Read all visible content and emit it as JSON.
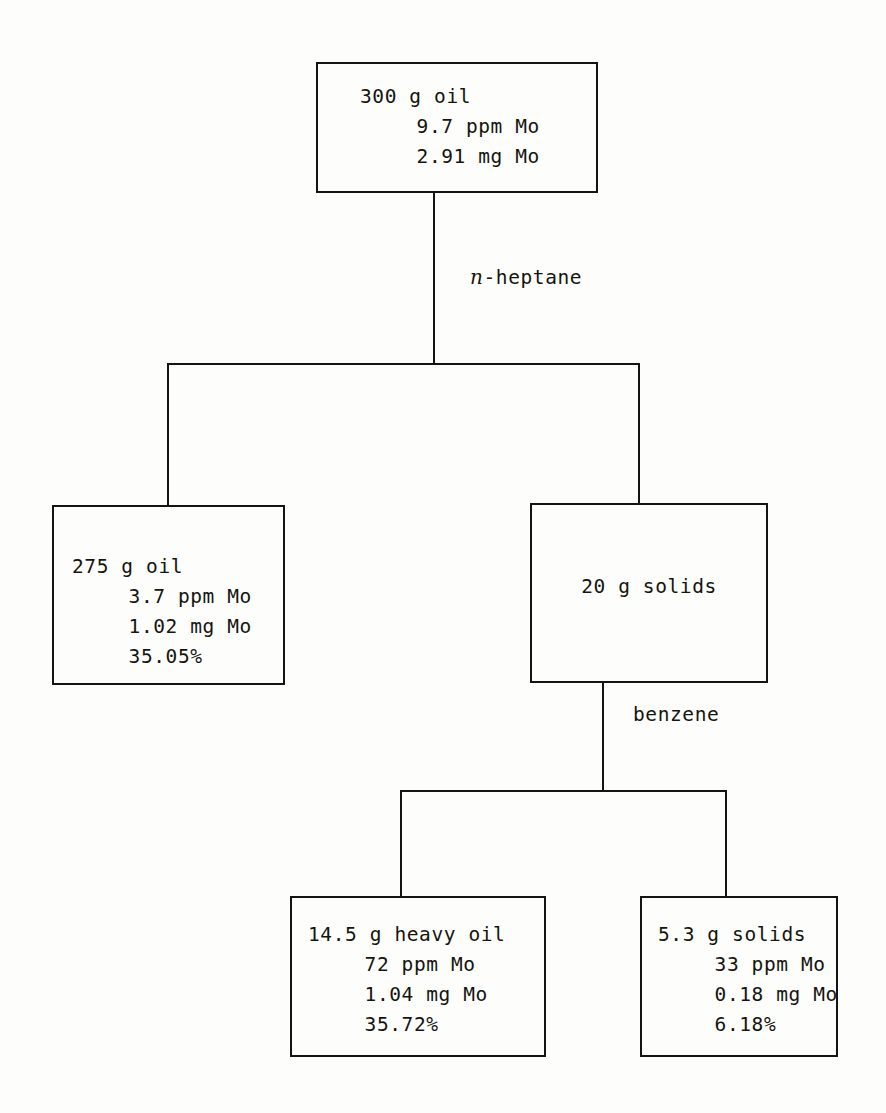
{
  "diagram": {
    "line_color": "#15150f",
    "background_color": "#fdfdfb"
  },
  "nodes": {
    "feed_oil": {
      "name": "300 g oil feed",
      "lines": [
        "300 g oil",
        "9.7 ppm Mo",
        "2.91 mg Mo"
      ],
      "mass": "300 g",
      "concentration_ppm": 9.7,
      "mo_mass_mg": 2.91
    },
    "deasphalted_oil": {
      "name": "275 g oil",
      "lines": [
        "275 g oil",
        "3.7 ppm Mo",
        "1.02 mg Mo",
        "35.05%"
      ],
      "mass": "275 g",
      "concentration_ppm": 3.7,
      "mo_mass_mg": 1.02,
      "percent": "35.05%"
    },
    "solids": {
      "name": "20 g solids",
      "lines": [
        "20 g solids"
      ],
      "mass": "20 g"
    },
    "heavy_oil": {
      "name": "14.5 g heavy oil",
      "lines": [
        "14.5 g heavy oil",
        "72 ppm Mo",
        "1.04 mg Mo",
        "35.72%"
      ],
      "mass": "14.5 g",
      "concentration_ppm": 72,
      "mo_mass_mg": 1.04,
      "percent": "35.72%"
    },
    "residual_solids": {
      "name": "5.3 g solids",
      "lines": [
        "5.3 g solids",
        "33 ppm Mo",
        "0.18 mg Mo",
        "6.18%"
      ],
      "mass": "5.3 g",
      "concentration_ppm": 33,
      "mo_mass_mg": 0.18,
      "percent": "6.18%"
    }
  },
  "edge_labels": {
    "heptane": {
      "italic_prefix": "n",
      "rest": "-heptane",
      "full": "n-heptane"
    },
    "benzene": {
      "full": "benzene"
    }
  }
}
